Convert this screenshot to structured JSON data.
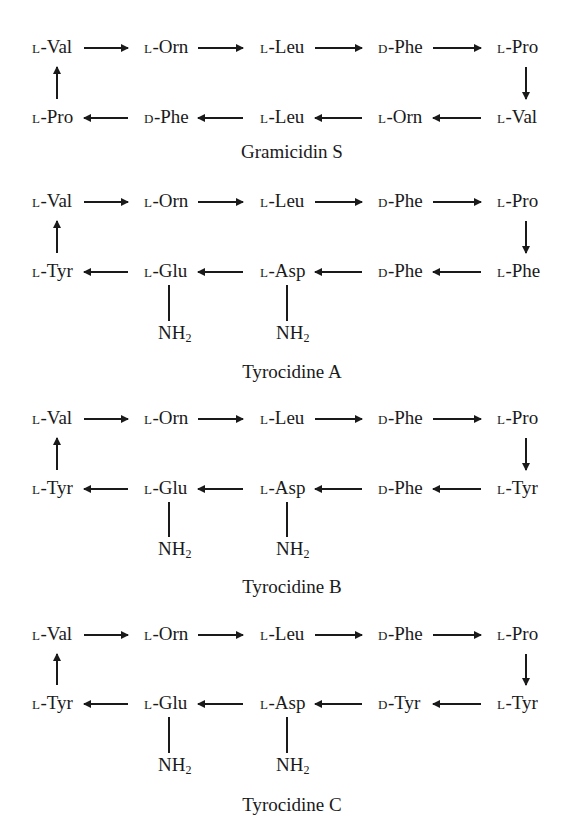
{
  "figure": {
    "peptides": [
      {
        "name": "Gramicidin S",
        "top_row": [
          {
            "config": "L",
            "residue": "Val"
          },
          {
            "config": "L",
            "residue": "Orn"
          },
          {
            "config": "L",
            "residue": "Leu"
          },
          {
            "config": "D",
            "residue": "Phe"
          },
          {
            "config": "L",
            "residue": "Pro"
          }
        ],
        "bottom_row": [
          {
            "config": "L",
            "residue": "Pro"
          },
          {
            "config": "D",
            "residue": "Phe"
          },
          {
            "config": "L",
            "residue": "Leu"
          },
          {
            "config": "L",
            "residue": "Orn"
          },
          {
            "config": "L",
            "residue": "Val"
          }
        ],
        "amide_labels": []
      },
      {
        "name": "Tyrocidine A",
        "top_row": [
          {
            "config": "L",
            "residue": "Val"
          },
          {
            "config": "L",
            "residue": "Orn"
          },
          {
            "config": "L",
            "residue": "Leu"
          },
          {
            "config": "D",
            "residue": "Phe"
          },
          {
            "config": "L",
            "residue": "Pro"
          }
        ],
        "bottom_row": [
          {
            "config": "L",
            "residue": "Tyr"
          },
          {
            "config": "L",
            "residue": "Glu"
          },
          {
            "config": "L",
            "residue": "Asp"
          },
          {
            "config": "D",
            "residue": "Phe"
          },
          {
            "config": "L",
            "residue": "Phe"
          }
        ],
        "amide_labels": [
          "NH",
          "NH"
        ]
      },
      {
        "name": "Tyrocidine B",
        "top_row": [
          {
            "config": "L",
            "residue": "Val"
          },
          {
            "config": "L",
            "residue": "Orn"
          },
          {
            "config": "L",
            "residue": "Leu"
          },
          {
            "config": "D",
            "residue": "Phe"
          },
          {
            "config": "L",
            "residue": "Pro"
          }
        ],
        "bottom_row": [
          {
            "config": "L",
            "residue": "Tyr"
          },
          {
            "config": "L",
            "residue": "Glu"
          },
          {
            "config": "L",
            "residue": "Asp"
          },
          {
            "config": "D",
            "residue": "Phe"
          },
          {
            "config": "L",
            "residue": "Tyr"
          }
        ],
        "amide_labels": [
          "NH",
          "NH"
        ]
      },
      {
        "name": "Tyrocidine C",
        "top_row": [
          {
            "config": "L",
            "residue": "Val"
          },
          {
            "config": "L",
            "residue": "Orn"
          },
          {
            "config": "L",
            "residue": "Leu"
          },
          {
            "config": "D",
            "residue": "Phe"
          },
          {
            "config": "L",
            "residue": "Pro"
          }
        ],
        "bottom_row": [
          {
            "config": "L",
            "residue": "Tyr"
          },
          {
            "config": "L",
            "residue": "Glu"
          },
          {
            "config": "L",
            "residue": "Asp"
          },
          {
            "config": "D",
            "residue": "Tyr"
          },
          {
            "config": "L",
            "residue": "Tyr"
          }
        ],
        "amide_labels": [
          "NH",
          "NH"
        ]
      }
    ],
    "subscript_2": "2",
    "separator": "-"
  }
}
